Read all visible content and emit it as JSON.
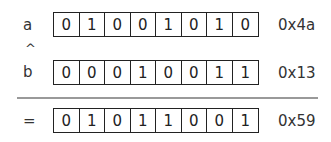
{
  "rows": [
    {
      "label": "a",
      "bits": [
        "0",
        "1",
        "0",
        "0",
        "1",
        "0",
        "1",
        "0"
      ],
      "hex": "0x4a"
    },
    {
      "label": "b",
      "bits": [
        "0",
        "0",
        "0",
        "1",
        "0",
        "0",
        "1",
        "1"
      ],
      "hex": "0x13"
    },
    {
      "label": "=",
      "bits": [
        "0",
        "1",
        "0",
        "1",
        "1",
        "0",
        "0",
        "1"
      ],
      "hex": "0x59"
    }
  ],
  "operator": "^"
}
